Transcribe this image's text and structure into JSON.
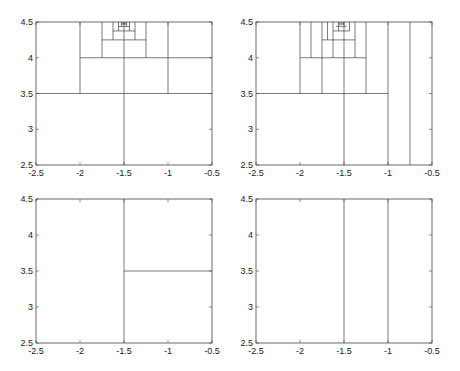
{
  "chart_data": [
    {
      "type": "line",
      "title": "",
      "panel": "top-left",
      "xlim": [
        -2.5,
        -0.5
      ],
      "ylim": [
        2.5,
        4.5
      ],
      "xticks": [
        "-2.5",
        "-2",
        "-1.5",
        "-1",
        "-0.5"
      ],
      "yticks": [
        "2.5",
        "3",
        "3.5",
        "4",
        "4.5"
      ],
      "grid": false,
      "segments": [
        [
          [
            -2.5,
            3.5
          ],
          [
            -0.5,
            3.5
          ]
        ],
        [
          [
            -1.5,
            2.5
          ],
          [
            -1.5,
            4.5
          ]
        ],
        [
          [
            -2,
            3.5
          ],
          [
            -2,
            4.5
          ]
        ],
        [
          [
            -1,
            3.5
          ],
          [
            -1,
            4.5
          ]
        ],
        [
          [
            -2,
            4
          ],
          [
            -0.5,
            4
          ]
        ],
        [
          [
            -1.75,
            4
          ],
          [
            -1.75,
            4.5
          ]
        ],
        [
          [
            -1.25,
            4
          ],
          [
            -1.25,
            4.5
          ]
        ],
        [
          [
            -1.75,
            4.25
          ],
          [
            -1.25,
            4.25
          ]
        ],
        [
          [
            -1.625,
            4.25
          ],
          [
            -1.625,
            4.5
          ]
        ],
        [
          [
            -1.375,
            4.25
          ],
          [
            -1.375,
            4.5
          ]
        ],
        [
          [
            -1.625,
            4.375
          ],
          [
            -1.375,
            4.375
          ]
        ],
        [
          [
            -1.5625,
            4.375
          ],
          [
            -1.5625,
            4.5
          ]
        ],
        [
          [
            -1.4375,
            4.375
          ],
          [
            -1.4375,
            4.5
          ]
        ],
        [
          [
            -1.5625,
            4.4375
          ],
          [
            -1.4375,
            4.4375
          ]
        ],
        [
          [
            -1.53,
            4.47
          ],
          [
            -1.47,
            4.47
          ]
        ],
        [
          [
            -1.53,
            4.485
          ],
          [
            -1.47,
            4.485
          ]
        ],
        [
          [
            -1.53,
            4.44
          ],
          [
            -1.53,
            4.5
          ]
        ],
        [
          [
            -1.47,
            4.44
          ],
          [
            -1.47,
            4.5
          ]
        ]
      ]
    },
    {
      "type": "line",
      "title": "",
      "panel": "top-right",
      "xlim": [
        -2.5,
        -0.5
      ],
      "ylim": [
        2.5,
        4.5
      ],
      "xticks": [
        "-2.5",
        "-2",
        "-1.5",
        "-1",
        "-0.5"
      ],
      "yticks": [
        "2.5",
        "3",
        "3.5",
        "4",
        "4.5"
      ],
      "grid": false,
      "segments": [
        [
          [
            -2.5,
            3.5
          ],
          [
            -1,
            3.5
          ]
        ],
        [
          [
            -1.5,
            2.5
          ],
          [
            -1.5,
            4.5
          ]
        ],
        [
          [
            -1,
            2.5
          ],
          [
            -1,
            4.5
          ]
        ],
        [
          [
            -0.75,
            2.5
          ],
          [
            -0.75,
            4.5
          ]
        ],
        [
          [
            -2,
            3.5
          ],
          [
            -2,
            4.5
          ]
        ],
        [
          [
            -1.75,
            3.5
          ],
          [
            -1.75,
            4.5
          ]
        ],
        [
          [
            -1.25,
            3.5
          ],
          [
            -1.25,
            4.5
          ]
        ],
        [
          [
            -2,
            4
          ],
          [
            -1.25,
            4
          ]
        ],
        [
          [
            -1.875,
            4
          ],
          [
            -1.875,
            4.5
          ]
        ],
        [
          [
            -1.75,
            4.25
          ],
          [
            -1.375,
            4.25
          ]
        ],
        [
          [
            -1.625,
            4
          ],
          [
            -1.625,
            4.5
          ]
        ],
        [
          [
            -1.375,
            4
          ],
          [
            -1.375,
            4.5
          ]
        ],
        [
          [
            -1.6875,
            4.25
          ],
          [
            -1.6875,
            4.5
          ]
        ],
        [
          [
            -1.625,
            4.375
          ],
          [
            -1.4375,
            4.375
          ]
        ],
        [
          [
            -1.5625,
            4.375
          ],
          [
            -1.5625,
            4.5
          ]
        ],
        [
          [
            -1.4375,
            4.375
          ],
          [
            -1.4375,
            4.5
          ]
        ],
        [
          [
            -1.59,
            4.44
          ],
          [
            -1.47,
            4.44
          ]
        ],
        [
          [
            -1.56,
            4.47
          ],
          [
            -1.5,
            4.47
          ]
        ],
        [
          [
            -1.56,
            4.485
          ],
          [
            -1.5,
            4.485
          ]
        ]
      ]
    },
    {
      "type": "line",
      "title": "",
      "panel": "bottom-left",
      "xlim": [
        -2.5,
        -0.5
      ],
      "ylim": [
        2.5,
        4.5
      ],
      "xticks": [
        "-2.5",
        "-2",
        "-1.5",
        "-1",
        "-0.5"
      ],
      "yticks": [
        "2.5",
        "3",
        "3.5",
        "4",
        "4.5"
      ],
      "grid": false,
      "segments": [
        [
          [
            -1.5,
            2.5
          ],
          [
            -1.5,
            4.5
          ]
        ],
        [
          [
            -1.5,
            3.5
          ],
          [
            -0.5,
            3.5
          ]
        ]
      ]
    },
    {
      "type": "line",
      "title": "",
      "panel": "bottom-right",
      "xlim": [
        -2.5,
        -0.5
      ],
      "ylim": [
        2.5,
        4.5
      ],
      "xticks": [
        "-2.5",
        "-2",
        "-1.5",
        "-1",
        "-0.5"
      ],
      "yticks": [
        "2.5",
        "3",
        "3.5",
        "4",
        "4.5"
      ],
      "grid": false,
      "segments": [
        [
          [
            -1.5,
            2.5
          ],
          [
            -1.5,
            4.5
          ]
        ],
        [
          [
            -1,
            2.5
          ],
          [
            -1,
            4.5
          ]
        ]
      ]
    }
  ],
  "layout": {
    "panels": [
      {
        "name": "top-left",
        "left": 36,
        "top": 22,
        "width": 176,
        "height": 143
      },
      {
        "name": "top-right",
        "left": 256,
        "top": 22,
        "width": 176,
        "height": 143
      },
      {
        "name": "bottom-left",
        "left": 36,
        "top": 199,
        "width": 176,
        "height": 144
      },
      {
        "name": "bottom-right",
        "left": 256,
        "top": 199,
        "width": 176,
        "height": 144
      }
    ],
    "xtick_values": [
      -2.5,
      -2,
      -1.5,
      -1,
      -0.5
    ],
    "ytick_values": [
      2.5,
      3,
      3.5,
      4,
      4.5
    ]
  }
}
